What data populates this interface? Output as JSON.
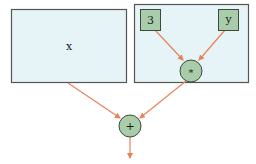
{
  "diagram": {
    "type": "expression-tree",
    "colors": {
      "box_fill": "#e6f4f8",
      "box_stroke": "#555555",
      "node_fill": "#a9ccaa",
      "node_stroke": "#3e4a3e",
      "edge": "#e8825a"
    },
    "subtrees": [
      {
        "id": "left",
        "label": "x"
      },
      {
        "id": "right",
        "label": ""
      }
    ],
    "nodes": [
      {
        "id": "const3",
        "shape": "square",
        "label": "3"
      },
      {
        "id": "vary",
        "shape": "square",
        "label": "y"
      },
      {
        "id": "mul",
        "shape": "circle",
        "label": "*"
      },
      {
        "id": "add",
        "shape": "circle",
        "label": "+"
      }
    ],
    "edges": [
      {
        "from": "const3",
        "to": "mul"
      },
      {
        "from": "vary",
        "to": "mul"
      },
      {
        "from": "left",
        "to": "add"
      },
      {
        "from": "mul",
        "to": "add"
      },
      {
        "from": "add",
        "to": "output"
      }
    ]
  }
}
